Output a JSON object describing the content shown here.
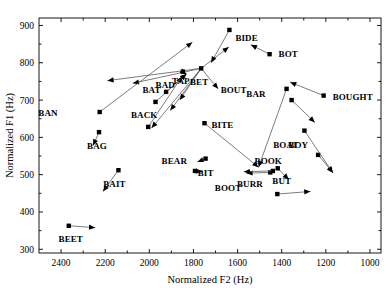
{
  "chart_data": {
    "type": "scatter",
    "title": "",
    "xlabel": "Normalized F2  (Hz)",
    "ylabel": "Normalized F1  (Hz)",
    "xlim": [
      2500,
      950
    ],
    "ylim": [
      920,
      290
    ],
    "x_reversed": true,
    "y_reversed": true,
    "grid": false,
    "legend": "none",
    "xticks": [
      2400,
      2200,
      2000,
      1800,
      1600,
      1400,
      1200,
      1000
    ],
    "yticks": [
      300,
      400,
      500,
      600,
      700,
      800,
      900
    ],
    "xtick_labels": [
      "2400",
      "2200",
      "2000",
      "1800",
      "1600",
      "1400",
      "1200",
      "1000"
    ],
    "ytick_labels": [
      "300",
      "400",
      "500",
      "600",
      "700",
      "800",
      "900"
    ],
    "points": [
      {
        "label": "BEET",
        "f2": 2365,
        "f1": 363,
        "f2_end": 2245,
        "f1_end": 358,
        "label_dx": 2,
        "label_dy": 16
      },
      {
        "label": "BOOT",
        "f2": 1420,
        "f1": 448,
        "f2_end": 1270,
        "f1_end": 455,
        "label_dx": -36,
        "label_dy": -3
      },
      {
        "label": "BAIT",
        "f2": 2140,
        "f1": 512,
        "f2_end": 2210,
        "f1_end": 455,
        "label_dx": -4,
        "label_dy": 17
      },
      {
        "label": "BEAR",
        "f2": 1793,
        "f1": 510,
        "f2_end": 1760,
        "f1_end": 508,
        "label_dx": -8,
        "label_dy": -7
      },
      {
        "label": "BOOK",
        "f2": 1452,
        "f1": 506,
        "f2_end": 1560,
        "f1_end": 504,
        "label_dx": -2,
        "label_dy": -8
      },
      {
        "label": "BURR",
        "f2": 1440,
        "f1": 510,
        "f2_end": 1572,
        "f1_end": 508,
        "label_dx": -10,
        "label_dy": 16
      },
      {
        "label": "BUT",
        "f2": 1418,
        "f1": 517,
        "f2_end": 1368,
        "f1_end": 487,
        "label_dx": 4,
        "label_dy": 16
      },
      {
        "label": "BIT",
        "f2": 1745,
        "f1": 543,
        "f2_end": 1782,
        "f1_end": 534,
        "label_dx": 0,
        "label_dy": 17
      },
      {
        "label": "BOY",
        "f2": 1235,
        "f1": 553,
        "f2_end": 1168,
        "f1_end": 505,
        "label_dx": -10,
        "label_dy": -7
      },
      {
        "label": "BAG",
        "f2": 2228,
        "f1": 614,
        "f2_end": 2255,
        "f1_end": 578,
        "label_dx": -2,
        "label_dy": 17
      },
      {
        "label": "BACK",
        "f2": 2005,
        "f1": 628,
        "f2_end": 1852,
        "f1_end": 763,
        "label_dx": -4,
        "label_dy": -9
      },
      {
        "label": "BOAT",
        "f2": 1297,
        "f1": 618,
        "f2_end": 1168,
        "f1_end": 505,
        "label_dx": -6,
        "label_dy": 17
      },
      {
        "label": "BITE",
        "f2": 1750,
        "f1": 638,
        "f2_end": 1505,
        "f1_end": 520,
        "label_dx": 7,
        "label_dy": 5
      },
      {
        "label": "BAN",
        "f2": 2225,
        "f1": 668,
        "f2_end": 1805,
        "f1_end": 855,
        "label_dx": -42,
        "label_dy": 4
      },
      {
        "label": "BAT",
        "f2": 1972,
        "f1": 695,
        "f2_end": 1832,
        "f1_end": 770,
        "label_dx": -4,
        "label_dy": -9
      },
      {
        "label": "BAR",
        "f2": 1355,
        "f1": 700,
        "f2_end": 1250,
        "f1_end": 640,
        "label_dx": -26,
        "label_dy": -3
      },
      {
        "label": "TAP",
        "f2": 1924,
        "f1": 722,
        "f2_end": 1832,
        "f1_end": 770,
        "label_dx": 6,
        "label_dy": -8
      },
      {
        "label": "BAD",
        "f2": 1848,
        "f1": 776,
        "f2_end": 1832,
        "f1_end": 770,
        "label_dx": -8,
        "label_dy": 16
      },
      {
        "label": "BOUGHT",
        "f2": 1210,
        "f1": 712,
        "f2_end": 1362,
        "f1_end": 748,
        "label_dx": 9,
        "label_dy": 4
      },
      {
        "label": "BOUT",
        "f2": 1378,
        "f1": 730,
        "f2_end": 1505,
        "f1_end": 520,
        "label_dx": -40,
        "label_dy": 4
      },
      {
        "label": "BET",
        "f2": 1765,
        "f1": 785,
        "f2_end": 1640,
        "f1_end": 842,
        "label_dx": -2,
        "label_dy": 17
      },
      {
        "label": "BOT",
        "f2": 1455,
        "f1": 823,
        "f2_end": 1540,
        "f1_end": 848,
        "label_dx": 9,
        "label_dy": 3
      },
      {
        "label": "BIDE",
        "f2": 1637,
        "f1": 888,
        "f2_end": 1720,
        "f1_end": 800,
        "label_dx": 6,
        "label_dy": 11
      }
    ],
    "extra_vectors": [
      {
        "from_f2": 1765,
        "from_f1": 785,
        "to_f2": 1990,
        "to_f1": 625
      },
      {
        "from_f2": 1765,
        "from_f1": 785,
        "to_f2": 1905,
        "to_f1": 672
      },
      {
        "from_f2": 1765,
        "from_f1": 785,
        "to_f2": 1862,
        "to_f1": 700
      },
      {
        "from_f2": 1765,
        "from_f1": 785,
        "to_f2": 1688,
        "to_f1": 730
      },
      {
        "from_f2": 1765,
        "from_f1": 785,
        "to_f2": 2075,
        "to_f1": 745
      },
      {
        "from_f2": 1765,
        "from_f1": 785,
        "to_f2": 2190,
        "to_f1": 752
      }
    ]
  }
}
